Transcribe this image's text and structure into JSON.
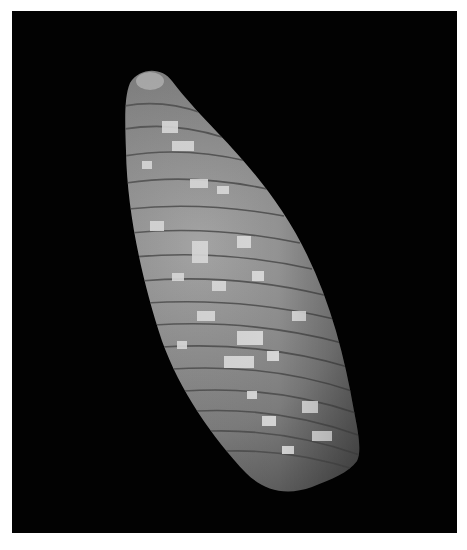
{
  "image": {
    "subject": "olive sea shell",
    "background_color": "#020202",
    "border_color": "#ffffff",
    "shell_colors": {
      "base": "#7a7a7a",
      "highlight": "#d8d8d8",
      "shadow": "#3a3a3a",
      "suture": "#4a4a4a"
    }
  }
}
